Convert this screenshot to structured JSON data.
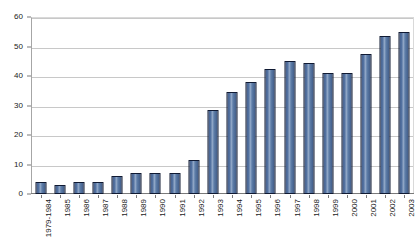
{
  "chart_data": {
    "type": "bar",
    "title": "",
    "subtitle": "",
    "xlabel": "",
    "ylabel": "",
    "ylim": [
      0,
      60
    ],
    "yticks": [
      0,
      10,
      20,
      30,
      40,
      50,
      60
    ],
    "grid": true,
    "legend": false,
    "legend_position": "none",
    "orientation": "vertical",
    "categories": [
      "1979-1984",
      "1985",
      "1986",
      "1987",
      "1988",
      "1989",
      "1990",
      "1991",
      "1992",
      "1993",
      "1994",
      "1995",
      "1996",
      "1997",
      "1998",
      "1999",
      "2000",
      "2001",
      "2002",
      "2003"
    ],
    "values": [
      4,
      3,
      4,
      4,
      6,
      7,
      7,
      7,
      11.5,
      28.5,
      34.5,
      38,
      42.5,
      45,
      44.5,
      41,
      41,
      47.5,
      53.5,
      55
    ],
    "series": [
      {
        "name": "",
        "values": [
          4,
          3,
          4,
          4,
          6,
          7,
          7,
          7,
          11.5,
          28.5,
          34.5,
          38,
          42.5,
          45,
          44.5,
          41,
          41,
          47.5,
          53.5,
          55
        ]
      }
    ]
  },
  "style": {
    "bar_fill": "#51709f",
    "bar_edge": "#101a33",
    "bar_highlight": "#8fa6c6",
    "gridline_color": "#c8c8c8",
    "axis_color": "#7a7a7a",
    "text_color": "#1a1a1a",
    "background": "#ffffff"
  }
}
